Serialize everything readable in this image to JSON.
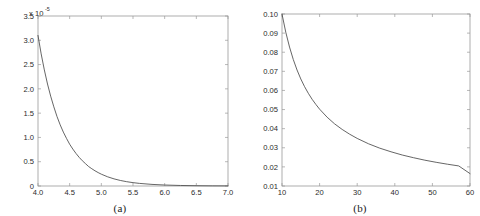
{
  "figure": {
    "panels": [
      {
        "caption": "(a)",
        "exp_base": "x 10",
        "exp_sup": "-5"
      },
      {
        "caption": "(b)",
        "exp_base": "",
        "exp_sup": ""
      }
    ]
  },
  "chart_data": [
    {
      "type": "line",
      "title": "",
      "panel_label": "(a)",
      "xlabel": "",
      "ylabel": "",
      "y_multiplier": "x 10^-5",
      "y_multiplier_base": "x 10",
      "y_multiplier_exponent": "-5",
      "xlim": [
        4.0,
        7.0
      ],
      "ylim": [
        0,
        3.5
      ],
      "grid": false,
      "legend": "none",
      "xticks": [
        4.0,
        4.5,
        5.0,
        5.5,
        6.0,
        6.5,
        7.0
      ],
      "xticklabels": [
        "4.0",
        "4.5",
        "5.0",
        "5.5",
        "6.0",
        "6.5",
        "7.0"
      ],
      "yticks": [
        0,
        0.5,
        1.0,
        1.5,
        2.0,
        2.5,
        3.0,
        3.5
      ],
      "yticklabels": [
        "0",
        "0.5",
        "1.0",
        "1.5",
        "2.0",
        "2.5",
        "3.0",
        "3.5"
      ],
      "series": [
        {
          "name": "decay",
          "x": [
            4.0,
            4.05,
            4.1,
            4.15,
            4.2,
            4.25,
            4.3,
            4.35,
            4.4,
            4.45,
            4.5,
            4.55,
            4.6,
            4.65,
            4.7,
            4.75,
            4.8,
            4.85,
            4.9,
            4.95,
            5.0,
            5.1,
            5.2,
            5.3,
            5.4,
            5.5,
            5.6,
            5.8,
            6.0,
            6.25,
            6.5,
            6.75,
            7.0
          ],
          "values": [
            3.1,
            2.72,
            2.39,
            2.1,
            1.85,
            1.63,
            1.43,
            1.26,
            1.11,
            0.98,
            0.86,
            0.76,
            0.67,
            0.59,
            0.52,
            0.46,
            0.4,
            0.355,
            0.313,
            0.276,
            0.243,
            0.189,
            0.147,
            0.114,
            0.089,
            0.069,
            0.054,
            0.033,
            0.02,
            0.011,
            0.006,
            0.003,
            0.002
          ]
        }
      ]
    },
    {
      "type": "line",
      "title": "",
      "panel_label": "(b)",
      "xlabel": "",
      "ylabel": "",
      "xlim": [
        10,
        60
      ],
      "ylim": [
        0.01,
        0.1
      ],
      "grid": false,
      "legend": "none",
      "xticks": [
        10,
        20,
        30,
        40,
        50,
        60
      ],
      "xticklabels": [
        "10",
        "20",
        "30",
        "40",
        "50",
        "60"
      ],
      "yticks": [
        0.01,
        0.02,
        0.03,
        0.04,
        0.05,
        0.06,
        0.07,
        0.08,
        0.09,
        0.1
      ],
      "yticklabels": [
        "0.01",
        "0.02",
        "0.03",
        "0.04",
        "0.05",
        "0.06",
        "0.07",
        "0.08",
        "0.09",
        "0.10"
      ],
      "series": [
        {
          "name": "decay",
          "x": [
            10,
            11,
            12,
            13,
            14,
            15,
            16,
            17,
            18,
            19,
            20,
            22,
            24,
            26,
            28,
            30,
            33,
            36,
            39,
            42,
            45,
            48,
            51,
            54,
            57,
            60
          ],
          "values": [
            0.1,
            0.0905,
            0.0827,
            0.0762,
            0.0707,
            0.066,
            0.062,
            0.0585,
            0.0554,
            0.0527,
            0.0502,
            0.046,
            0.0425,
            0.0396,
            0.0371,
            0.0349,
            0.0321,
            0.0298,
            0.0279,
            0.0262,
            0.0248,
            0.0235,
            0.0224,
            0.0214,
            0.0205,
            0.0165
          ]
        }
      ]
    }
  ]
}
